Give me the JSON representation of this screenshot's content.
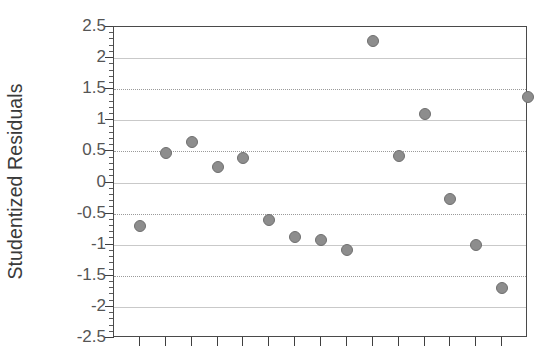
{
  "chart_data": {
    "type": "scatter",
    "title": "",
    "xlabel": "",
    "ylabel": "Studentized Residuals",
    "ylim": [
      -2.5,
      2.5
    ],
    "ytick_labels": [
      "2.5",
      "2",
      "1.5",
      "1",
      "0.5",
      "0",
      "-0.5",
      "-1",
      "-1.5",
      "-2",
      "-2.5"
    ],
    "ytick_values": [
      2.5,
      2,
      1.5,
      1,
      0.5,
      0,
      -0.5,
      -1,
      -1.5,
      -2,
      -2.5
    ],
    "ytick_minor_step": 0.1,
    "xlim": [
      0,
      16
    ],
    "xtick_labels": [],
    "xtick_count": 15,
    "grid": "horizontal",
    "legend": "none",
    "marker_color": "#8d8d8d",
    "marker_edge_color": "#6f6f6f",
    "axis_color": "#4a4a4a",
    "grid_color": "#9a9a9a",
    "x": [
      1,
      2,
      3,
      4,
      5,
      6,
      7,
      8,
      9,
      10,
      11,
      12,
      13,
      14,
      15,
      16
    ],
    "values": [
      -0.7,
      0.48,
      0.65,
      0.25,
      0.4,
      -0.6,
      -0.88,
      -0.93,
      -1.08,
      2.28,
      0.43,
      1.1,
      -0.27,
      -1.0,
      -1.7,
      1.38
    ]
  }
}
